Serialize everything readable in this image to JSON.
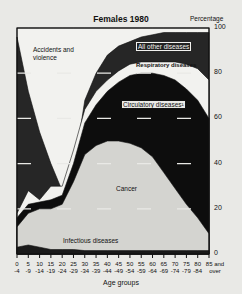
{
  "chart_data": {
    "type": "area",
    "stacked": true,
    "title": "Females 1980",
    "ylabel": "Percentage",
    "xlabel": "Age groups",
    "ylim": [
      0,
      100
    ],
    "yticks": [
      0,
      20,
      40,
      60,
      80,
      100
    ],
    "grid": true,
    "categories": [
      "0-4",
      "5-9",
      "10-14",
      "15-19",
      "20-24",
      "25-29",
      "30-34",
      "35-39",
      "40-44",
      "45-49",
      "50-54",
      "55-59",
      "60-64",
      "65-69",
      "70-74",
      "75-79",
      "80-84",
      "85 and over"
    ],
    "x_tick_top": [
      "0",
      "5",
      "10",
      "15",
      "20",
      "25",
      "30",
      "35",
      "40",
      "45",
      "50",
      "55",
      "60",
      "65",
      "70",
      "75",
      "80",
      "85 and"
    ],
    "x_tick_bottom": [
      "-4",
      "-9",
      "-14",
      "-19",
      "-24",
      "-29",
      "-34",
      "-39",
      "-44",
      "-49",
      "-54",
      "-59",
      "-64",
      "-69",
      "-74",
      "-79",
      "-84",
      "over"
    ],
    "series": [
      {
        "name": "Infectious diseases",
        "values": [
          3,
          4,
          3,
          2,
          2,
          2,
          1.5,
          1.5,
          1.5,
          1.5,
          1.5,
          1.5,
          1.5,
          1.5,
          1.5,
          1.5,
          1.5,
          1.5
        ]
      },
      {
        "name": "Cancer",
        "values": [
          9,
          14,
          17,
          18,
          20,
          30,
          42.5,
          46.5,
          48.5,
          48.5,
          47.5,
          45.5,
          41.5,
          34.5,
          27.5,
          20.5,
          14.5,
          7.5
        ]
      },
      {
        "name": "Circulatory diseases",
        "values": [
          4,
          4,
          3,
          4,
          4,
          8,
          14,
          18,
          22,
          26,
          30,
          33,
          37,
          43,
          48,
          51,
          52,
          51
        ]
      },
      {
        "name": "Respiratory diseases",
        "values": [
          2,
          6,
          1,
          6,
          4,
          6,
          6,
          6,
          5,
          5,
          5,
          5,
          5,
          6,
          8,
          11,
          14,
          17
        ]
      },
      {
        "name": "All other diseases",
        "values": [
          78,
          44,
          30,
          10,
          -2,
          -10,
          4,
          8,
          11,
          11,
          10,
          11,
          12,
          13,
          13,
          14,
          16,
          21
        ]
      },
      {
        "name": "Accidents and violence",
        "values": [
          4,
          28,
          46,
          60,
          72,
          64,
          32,
          20,
          12,
          8,
          6,
          4,
          3,
          2,
          2,
          2,
          2,
          2
        ]
      }
    ],
    "cumulative_tops": {
      "Infectious diseases": [
        3,
        4,
        3,
        2,
        2,
        2,
        1.5,
        1.5,
        1.5,
        1.5,
        1.5,
        1.5,
        1.5,
        1.5,
        1.5,
        1.5,
        1.5,
        1.5
      ],
      "Cancer": [
        12,
        18,
        20,
        20,
        22,
        32,
        44,
        48,
        50,
        50,
        49,
        47,
        43,
        36,
        29,
        22,
        16,
        9
      ],
      "Circulatory diseases": [
        16,
        22,
        23,
        24,
        26,
        40,
        58,
        66,
        72,
        76,
        79,
        80,
        80,
        79,
        77,
        73,
        68,
        60
      ],
      "Respiratory diseases": [
        18,
        28,
        24,
        30,
        30,
        46,
        64,
        72,
        77,
        81,
        84,
        85,
        85,
        85,
        85,
        84,
        82,
        77
      ],
      "All other diseases": [
        96,
        72,
        54,
        40,
        28,
        36,
        68,
        80,
        88,
        92,
        94,
        96,
        97,
        98,
        98,
        98,
        98,
        98
      ],
      "Accidents and violence": [
        100,
        100,
        100,
        100,
        100,
        100,
        100,
        100,
        100,
        100,
        100,
        100,
        100,
        100,
        100,
        100,
        100,
        100
      ]
    },
    "annotations": [
      "Accidents and violence",
      "All other diseases",
      "Respiratory diseases",
      "Circulatory diseases¹",
      "Cancer",
      "Infectious diseases"
    ],
    "colors": {
      "Infectious diseases": "#1a1a1a",
      "Cancer": "#d4d4d0",
      "Circulatory diseases": "#0d0d0d",
      "Respiratory diseases": "#f2f2ef",
      "All other diseases": "#262626",
      "Accidents and violence": "#f2f2ef"
    }
  },
  "labels": {
    "title": "Females 1980",
    "ylabel": "Percentage",
    "xlabel": "Age groups",
    "accidents_line1": "Accidents and",
    "accidents_line2": "violence",
    "all_other": "All other diseases",
    "respiratory": "Respiratory diseases",
    "circulatory": "Circulatory diseases¹",
    "cancer": "Cancer",
    "infectious": "Infectious diseases"
  }
}
